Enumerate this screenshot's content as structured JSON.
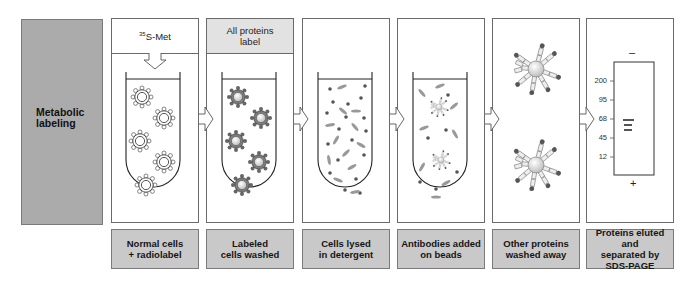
{
  "sidebar": {
    "label_line1": "Metabolic",
    "label_line2": "labeling"
  },
  "panels": [
    {
      "header_sup": "35",
      "header_text": "S-Met",
      "caption_line1": "Normal cells",
      "caption_line2": "+ radiolabel"
    },
    {
      "header_line1": "All  proteins",
      "header_line2": "label",
      "caption_line1": "Labeled",
      "caption_line2": "cells  washed"
    },
    {
      "caption_line1": "Cells  lysed",
      "caption_line2": "in  detergent"
    },
    {
      "caption_line1": "Antibodies  added",
      "caption_line2": "on  beads"
    },
    {
      "caption_line1": "Other  proteins",
      "caption_line2": "washed  away"
    },
    {
      "caption_line1": "Proteins eluted and",
      "caption_line2": "separated by",
      "caption_line3": "SDS-PAGE"
    }
  ],
  "gel": {
    "top_sign": "–",
    "bottom_sign": "+",
    "markers": [
      "200",
      "95",
      "68",
      "45",
      "12"
    ]
  },
  "icons": [
    "arrow-down-icon",
    "arrow-right-icon",
    "cell-icon",
    "labeled-cell-icon",
    "bead-antibody-icon",
    "gel-band-icon"
  ],
  "colors": {
    "sidebar": "#ababab",
    "caption": "#c9c9c9",
    "header_gray": "#e2e2e2",
    "labeled_cell": "#7d7d7d",
    "dot": "#555555"
  }
}
